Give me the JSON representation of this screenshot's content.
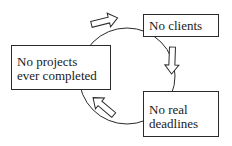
{
  "diagram": {
    "type": "cycle",
    "nodes": [
      {
        "id": "clients",
        "lines": [
          "No clients"
        ]
      },
      {
        "id": "deadlines",
        "lines": [
          "No real",
          "deadlines"
        ]
      },
      {
        "id": "projects",
        "lines": [
          "No projects",
          "ever completed"
        ]
      }
    ],
    "edges": [
      {
        "from": "clients",
        "to": "deadlines",
        "style": "hollow-block-arrow"
      },
      {
        "from": "deadlines",
        "to": "projects",
        "style": "hollow-block-arrow"
      },
      {
        "from": "projects",
        "to": "clients",
        "style": "hollow-block-arrow"
      }
    ],
    "colors": {
      "stroke": "#2a2a2a",
      "fill": "#ffffff",
      "text": "#1a1a1a"
    }
  }
}
